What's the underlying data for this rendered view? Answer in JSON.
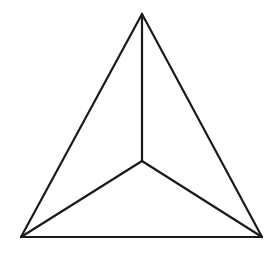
{
  "figure": {
    "name": "tetrahedron-wireframe",
    "background_color": "#ffffff",
    "stroke_color": "#1a1a1a",
    "stroke_width": 2.2,
    "canvas": {
      "width": 279,
      "height": 254
    },
    "vertices": {
      "apex": {
        "label": "apex",
        "x": 142,
        "y": 14
      },
      "bottom_left": {
        "label": "bottom-left",
        "x": 21,
        "y": 237
      },
      "bottom_right": {
        "label": "bottom-right",
        "x": 262,
        "y": 237
      },
      "center": {
        "label": "interior-junction",
        "x": 142,
        "y": 161
      }
    },
    "outline_path": "M 142 14 L 262 237 L 21 237 Z",
    "spokes": [
      {
        "name": "spoke-to-apex",
        "path": "M 142 161 L 142 14"
      },
      {
        "name": "spoke-to-bottom-left",
        "path": "M 142 161 L 21 237"
      },
      {
        "name": "spoke-to-bottom-right",
        "path": "M 142 161 L 262 237"
      }
    ],
    "edges": [
      {
        "name": "edge-left",
        "path": "M 142 14 L 21 237"
      },
      {
        "name": "edge-right",
        "path": "M 142 14 L 262 237"
      },
      {
        "name": "edge-bottom",
        "path": "M 21 237 L 262 237"
      }
    ]
  }
}
